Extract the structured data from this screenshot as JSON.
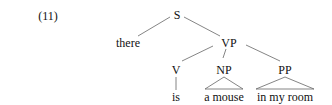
{
  "example_number": "(11)",
  "tree": {
    "S": "S",
    "there": "there",
    "VP": "VP",
    "V": "V",
    "NP": "NP",
    "PP": "PP",
    "is": "is",
    "a_mouse": "a mouse",
    "in_my_room": "in my room"
  },
  "colors": {
    "line": "#555555",
    "text": "#111111"
  }
}
